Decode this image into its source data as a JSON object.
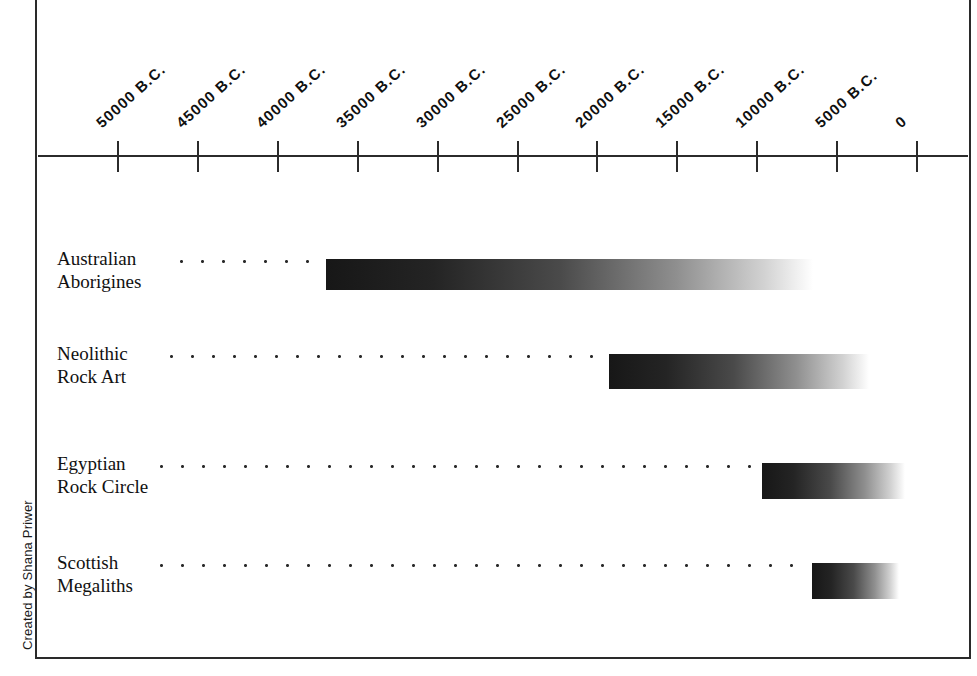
{
  "figure": {
    "credit": "Created by Shana Priwer"
  },
  "chart_data": {
    "type": "bar",
    "orientation": "horizontal",
    "title": "",
    "xlabel": "",
    "ylabel": "",
    "grid": false,
    "legend": null,
    "axis": {
      "ticks": [
        {
          "label": "50000 B.C.",
          "value": -50000
        },
        {
          "label": "45000 B.C.",
          "value": -45000
        },
        {
          "label": "40000 B.C.",
          "value": -40000
        },
        {
          "label": "35000 B.C.",
          "value": -35000
        },
        {
          "label": "30000 B.C.",
          "value": -30000
        },
        {
          "label": "25000 B.C.",
          "value": -25000
        },
        {
          "label": "20000 B.C.",
          "value": -20000
        },
        {
          "label": "15000 B.C.",
          "value": -15000
        },
        {
          "label": "10000 B.C.",
          "value": -10000
        },
        {
          "label": "5000 B.C.",
          "value": -5000
        },
        {
          "label": "0",
          "value": 0
        }
      ],
      "xlim": [
        -50000,
        0
      ],
      "tick_step": 5000
    },
    "categories": [
      "Australian Aborigines",
      "Neolithic Rock Art",
      "Egyptian Rock Circle",
      "Scottish Megaliths"
    ],
    "bars": [
      {
        "label_line1": "Australian",
        "label_line2": "Aborigines",
        "start": -37000,
        "end": -6500,
        "fade": "dark-to-light"
      },
      {
        "label_line1": "Neolithic",
        "label_line2": "Rock Art",
        "start": -19300,
        "end": -3000,
        "fade": "dark-to-light"
      },
      {
        "label_line1": "Egyptian",
        "label_line2": "Rock Circle",
        "start": -9700,
        "end": -750,
        "fade": "dark-to-light"
      },
      {
        "label_line1": "Scottish",
        "label_line2": "Megaliths",
        "start": -6600,
        "end": -1100,
        "fade": "dark-to-light"
      }
    ]
  },
  "colors": {
    "ink": "#1a1a1a",
    "rule": "#2a2a2a",
    "bar_dark": "#171717",
    "bar_light": "#ffffff",
    "background": "#ffffff"
  }
}
